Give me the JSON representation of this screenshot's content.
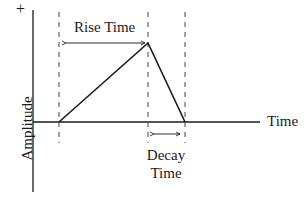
{
  "diagram": {
    "type": "pulse-envelope",
    "labels": {
      "y_axis_positive": "+",
      "y_axis": "Amplitude",
      "x_axis": "Time",
      "rise": "Rise Time",
      "decay_line1": "Decay",
      "decay_line2": "Time"
    },
    "colors": {
      "line": "#1a1a1a",
      "dashed": "#555555"
    },
    "points": {
      "start": [
        59,
        122
      ],
      "peak": [
        148,
        43
      ],
      "end": [
        185,
        122
      ]
    }
  }
}
